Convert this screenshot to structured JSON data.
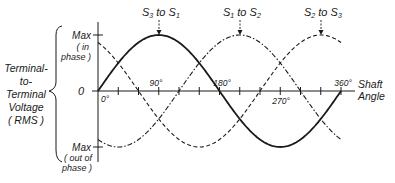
{
  "chart_data": {
    "type": "line",
    "title": "",
    "xlabel": "Shaft Angle",
    "ylabel": "Terminal-to-Terminal Voltage (RMS)",
    "ylabel_lines": [
      "Terminal-",
      "to-",
      "Terminal",
      "Voltage",
      "(RMS)"
    ],
    "x_ticks": [
      {
        "value": 0,
        "label": "0°"
      },
      {
        "value": 90,
        "label": "90°"
      },
      {
        "value": 180,
        "label": "180°"
      },
      {
        "value": 270,
        "label": "270°"
      },
      {
        "value": 360,
        "label": "360°"
      }
    ],
    "x_minor_tick_step": 30,
    "xlim": [
      0,
      360
    ],
    "y_ticks": [
      {
        "value": 1,
        "label_lines": [
          "Max",
          "(in",
          "phase)"
        ]
      },
      {
        "value": 0,
        "label_lines": [
          "0"
        ]
      },
      {
        "value": -1,
        "label_lines": [
          "Max",
          "(out of",
          "phase)"
        ]
      }
    ],
    "ylim": [
      -1,
      1
    ],
    "grid": false,
    "legend_position": "annotations above peaks",
    "series": [
      {
        "name": "S3 to S1",
        "style": "solid",
        "phase_deg": 0,
        "peak_at_deg": 90,
        "formula": "sin(θ)"
      },
      {
        "name": "S1 to S2",
        "style": "dash-dot",
        "phase_deg": -120,
        "peak_at_deg": 210,
        "formula": "sin(θ−120°)"
      },
      {
        "name": "S2 to S3",
        "style": "dashed",
        "phase_deg": -240,
        "peak_at_deg": 330,
        "formula": "sin(θ−240°)"
      }
    ],
    "annotations": [
      {
        "text": "S3 to S1",
        "sub": [
          "3",
          "1"
        ],
        "points_to_deg": 90
      },
      {
        "text": "S1 to S2",
        "sub": [
          "1",
          "2"
        ],
        "points_to_deg": 210
      },
      {
        "text": "S2 to S3",
        "sub": [
          "2",
          "3"
        ],
        "points_to_deg": 330
      }
    ]
  },
  "labels": {
    "max_in": "Max",
    "in_phase_1": "( in",
    "in_phase_2": "phase )",
    "zero": "0",
    "max_out": "Max",
    "out_phase_1": "( out of",
    "out_phase_2": "phase )",
    "ylabel_1": "Terminal-",
    "ylabel_2": "to-",
    "ylabel_3": "Terminal",
    "ylabel_4": "Voltage",
    "ylabel_5": "( RMS )",
    "x_0": "0°",
    "x_90": "90°",
    "x_180": "180°",
    "x_270": "270°",
    "x_360": "360°",
    "xlabel_1": "Shaft",
    "xlabel_2": "Angle",
    "s31_a": "S",
    "s31_a_sub": "3",
    "s31_to": " to ",
    "s31_b": "S",
    "s31_b_sub": "1",
    "s12_a": "S",
    "s12_a_sub": "1",
    "s12_to": " to ",
    "s12_b": "S",
    "s12_b_sub": "2",
    "s23_a": "S",
    "s23_a_sub": "2",
    "s23_to": " to ",
    "s23_b": "S",
    "s23_b_sub": "3"
  },
  "colors": {
    "ink": "#1a1a1a",
    "background": "#ffffff"
  }
}
